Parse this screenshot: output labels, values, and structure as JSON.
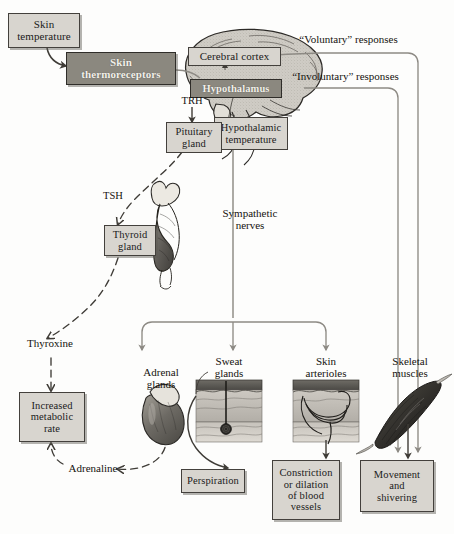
{
  "diagram": {
    "colors": {
      "box_light_fill": "#d8d5cf",
      "box_dark_fill": "#8b887f",
      "box_border": "#43403c",
      "arrow_gray": "#8d8a84",
      "arrow_dark": "#4a4742",
      "brain_fill": "#cfccc5",
      "organ_dark": "#6f6c66",
      "page_background": "#fdfdfc"
    },
    "boxes": [
      {
        "id": "skin-temperature",
        "label": "Skin\ntemperature",
        "style": "light"
      },
      {
        "id": "skin-thermoreceptors",
        "label": "Skin\nthermoreceptors",
        "style": "dark"
      },
      {
        "id": "cerebral-cortex",
        "label": "Cerebral cortex",
        "style": "light"
      },
      {
        "id": "hypothalamus",
        "label": "Hypothalamus",
        "style": "dark"
      },
      {
        "id": "hypothalamic-temperature",
        "label": "Hypothalamic\ntemperature",
        "style": "light"
      },
      {
        "id": "pituitary-gland",
        "label": "Pituitary\ngland",
        "style": "light"
      },
      {
        "id": "thyroid-gland",
        "label": "Thyroid\ngland",
        "style": "light"
      },
      {
        "id": "increased-metabolic-rate",
        "label": "Increased\nmetabolic\nrate",
        "style": "light"
      },
      {
        "id": "perspiration",
        "label": "Perspiration",
        "style": "light"
      },
      {
        "id": "constriction-dilation",
        "label": "Constriction\nor dilation\nof blood\nvessels",
        "style": "light"
      },
      {
        "id": "movement-shivering",
        "label": "Movement\nand\nshivering",
        "style": "light"
      }
    ],
    "captions": [
      {
        "id": "voluntary-responses",
        "label": "“Voluntary” responses"
      },
      {
        "id": "involuntary-responses",
        "label": "“Involuntary” responses"
      },
      {
        "id": "trh",
        "label": "TRH"
      },
      {
        "id": "tsh",
        "label": "TSH"
      },
      {
        "id": "sympathetic-nerves",
        "label": "Sympathetic\nnerves"
      },
      {
        "id": "thyroxine",
        "label": "Thyroxine"
      },
      {
        "id": "adrenaline",
        "label": "Adrenaline"
      },
      {
        "id": "adrenal-glands",
        "label": "Adrenal\nglands"
      },
      {
        "id": "sweat-glands",
        "label": "Sweat\nglands"
      },
      {
        "id": "skin-arterioles",
        "label": "Skin\narterioles"
      },
      {
        "id": "skeletal-muscles",
        "label": "Skeletal\nmuscles"
      }
    ]
  }
}
